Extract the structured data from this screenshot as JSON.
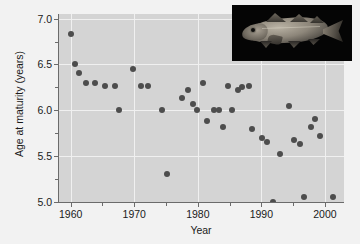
{
  "chart_data": {
    "type": "scatter",
    "title": "",
    "xlabel": "Year",
    "ylabel": "Age at maturity (years)",
    "xlim": [
      1958,
      2003
    ],
    "ylim": [
      5.0,
      7.05
    ],
    "xticks": [
      1960,
      1970,
      1980,
      1990,
      2000
    ],
    "xticklabels": [
      "1960",
      "1970",
      "1980",
      "1990",
      "2000"
    ],
    "yticks": [
      5.0,
      5.5,
      6.0,
      6.5,
      7.0
    ],
    "yticklabels": [
      "5.0",
      "5.5",
      "6.0",
      "6.5",
      "7.0"
    ],
    "x_minor_ticks": [
      1965,
      1975,
      1985,
      1995
    ],
    "y_minor_ticks": [
      5.25,
      5.75,
      6.25,
      6.75
    ],
    "grid": true,
    "grid_color": "#f0f0f0",
    "panel_color": "#d4d4d4",
    "figure_color": "#f2f2f2",
    "marker_color": "#4d4d4d",
    "marker_size_px": 6,
    "legend": null,
    "points": [
      {
        "x": 1960.0,
        "y": 6.83
      },
      {
        "x": 1960.6,
        "y": 6.5
      },
      {
        "x": 1961.3,
        "y": 6.41
      },
      {
        "x": 1962.4,
        "y": 6.3
      },
      {
        "x": 1963.8,
        "y": 6.3
      },
      {
        "x": 1965.4,
        "y": 6.27
      },
      {
        "x": 1967.0,
        "y": 6.27
      },
      {
        "x": 1967.6,
        "y": 6.0
      },
      {
        "x": 1969.8,
        "y": 6.45
      },
      {
        "x": 1971.0,
        "y": 6.27
      },
      {
        "x": 1972.1,
        "y": 6.27
      },
      {
        "x": 1974.4,
        "y": 6.0
      },
      {
        "x": 1975.2,
        "y": 5.3
      },
      {
        "x": 1977.5,
        "y": 6.13
      },
      {
        "x": 1978.4,
        "y": 6.22
      },
      {
        "x": 1979.3,
        "y": 6.07
      },
      {
        "x": 1979.9,
        "y": 6.0
      },
      {
        "x": 1980.8,
        "y": 6.3
      },
      {
        "x": 1981.5,
        "y": 5.88
      },
      {
        "x": 1982.6,
        "y": 6.0
      },
      {
        "x": 1983.4,
        "y": 6.0
      },
      {
        "x": 1983.9,
        "y": 5.82
      },
      {
        "x": 1984.8,
        "y": 6.27
      },
      {
        "x": 1985.4,
        "y": 6.0
      },
      {
        "x": 1986.3,
        "y": 6.22
      },
      {
        "x": 1986.9,
        "y": 6.25
      },
      {
        "x": 1988.0,
        "y": 6.27
      },
      {
        "x": 1988.6,
        "y": 5.8
      },
      {
        "x": 1990.1,
        "y": 5.7
      },
      {
        "x": 1990.9,
        "y": 5.65
      },
      {
        "x": 1991.9,
        "y": 5.0
      },
      {
        "x": 1993.0,
        "y": 5.52
      },
      {
        "x": 1994.4,
        "y": 6.05
      },
      {
        "x": 1995.2,
        "y": 5.68
      },
      {
        "x": 1996.0,
        "y": 5.63
      },
      {
        "x": 1996.7,
        "y": 5.05
      },
      {
        "x": 1997.8,
        "y": 5.82
      },
      {
        "x": 1998.4,
        "y": 5.9
      },
      {
        "x": 1999.3,
        "y": 5.72
      },
      {
        "x": 2001.3,
        "y": 5.05
      }
    ]
  },
  "inset": {
    "name": "atlantic-cod-photograph",
    "caption": ""
  }
}
